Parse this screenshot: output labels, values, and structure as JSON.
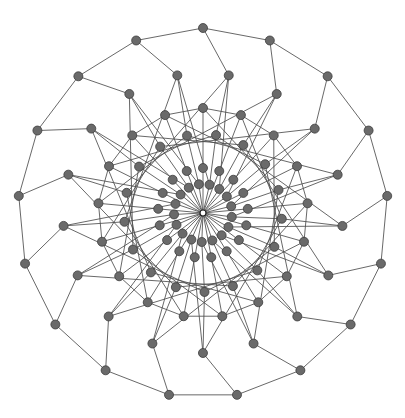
{
  "diagram": {
    "type": "network-graph",
    "center": [
      203,
      213
    ],
    "colors": {
      "background": "#ffffff",
      "node_fill": "#6a6a6a",
      "node_stroke": "#3c3c3c",
      "edge": "#4d4d4d"
    },
    "node_radius": 4.5,
    "symmetry": 17,
    "rings": [
      {
        "name": "outer",
        "radius": 185,
        "count": 17,
        "angle_offset_deg": -90
      },
      {
        "name": "ring2",
        "radius": 140,
        "count": 17,
        "angle_offset_deg": -79.4
      },
      {
        "name": "ring3",
        "radius": 105,
        "count": 17,
        "angle_offset_deg": -90
      },
      {
        "name": "ring4",
        "radius": 79,
        "count": 17,
        "angle_offset_deg": -80.5
      },
      {
        "name": "ring5",
        "radius": 45,
        "count": 17,
        "angle_offset_deg": -90
      },
      {
        "name": "ring6",
        "radius": 29,
        "count": 17,
        "angle_offset_deg": -77
      }
    ],
    "edge_rules": [
      {
        "from": "outer",
        "to": "outer",
        "shift": 1
      },
      {
        "from": "outer",
        "to": "ring2",
        "shift": 0
      },
      {
        "from": "ring2",
        "to": "ring4",
        "shift": 0
      },
      {
        "from": "ring2",
        "to": "ring6",
        "shift": 1
      },
      {
        "from": "ring3",
        "to": "ring3",
        "shift": 1
      },
      {
        "from": "ring3",
        "to": "ring5",
        "shift": 0
      },
      {
        "from": "ring3",
        "to": "ring4",
        "shift": 3
      },
      {
        "from": "ring4",
        "to": "ring6",
        "shift": 0
      },
      {
        "from": "ring4",
        "to": "ring2",
        "shift": 4
      },
      {
        "from": "ring5",
        "to": "hub",
        "shift": 0
      },
      {
        "from": "ring6",
        "to": "hub",
        "shift": 0
      }
    ],
    "node_count": 103
  }
}
